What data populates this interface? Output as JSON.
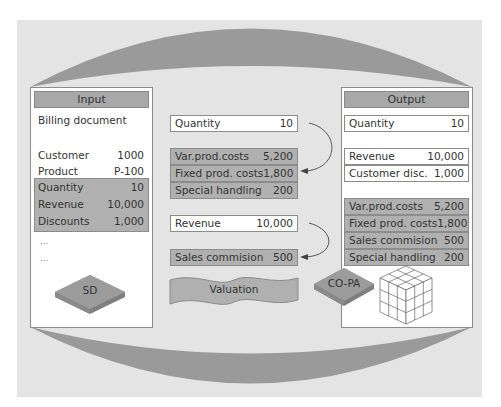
{
  "input_panel": {
    "title": "Input",
    "document": "Billing document",
    "fields": [
      {
        "label": "Customer",
        "value": "1000"
      },
      {
        "label": "Product",
        "value": "P-100"
      }
    ],
    "highlighted_fields": [
      {
        "label": "Quantity",
        "value": "10"
      },
      {
        "label": "Revenue",
        "value": "10,000"
      },
      {
        "label": "Discounts",
        "value": "1,000"
      }
    ],
    "ellipsis": [
      "...",
      "..."
    ],
    "module": "SD"
  },
  "valuation": {
    "group1_source": {
      "label": "Quantity",
      "value": "10"
    },
    "group1_results": [
      {
        "label": "Var.prod.costs",
        "value": "5,200"
      },
      {
        "label": "Fixed prod. costs",
        "value": "1,800"
      },
      {
        "label": "Special handling",
        "value": "200"
      }
    ],
    "group2_source": {
      "label": "Revenue",
      "value": "10,000"
    },
    "group2_results": [
      {
        "label": "Sales commision",
        "value": "500"
      }
    ],
    "banner": "Valuation",
    "target_module": "CO-PA"
  },
  "output_panel": {
    "title": "Output",
    "quantity": {
      "label": "Quantity",
      "value": "10"
    },
    "revenue_fields": [
      {
        "label": "Revenue",
        "value": "10,000"
      },
      {
        "label": "Customer disc.",
        "value": "1,000"
      }
    ],
    "cost_fields": [
      {
        "label": "Var.prod.costs",
        "value": "5,200"
      },
      {
        "label": "Fixed prod. costs",
        "value": "1,800"
      },
      {
        "label": "Sales commision",
        "value": "500"
      },
      {
        "label": "Special handling",
        "value": "200"
      }
    ],
    "icon": "cube-icon"
  },
  "colors": {
    "panel_bg": "#e4e4e4",
    "arc": "#9a9a9a",
    "header_gray": "#a8a8a8",
    "field_gray": "#b0b0b0",
    "tile": "#9c9c9c"
  }
}
